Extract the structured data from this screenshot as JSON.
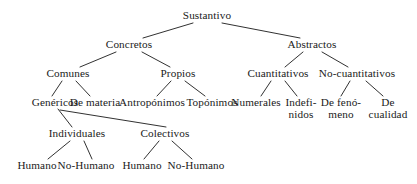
{
  "diagram": {
    "title": "Sustantivo",
    "type": "tree-taxonomy",
    "language": "es",
    "colors": {
      "background": "#ffffff",
      "text": "#1a1a1a",
      "edge": "#1a1a1a"
    },
    "nodes": [
      {
        "id": "sustantivo",
        "label": "Sustantivo",
        "lines": [
          "Sustantivo"
        ],
        "x": 207,
        "y": 16,
        "level": 0
      },
      {
        "id": "concretos",
        "label": "Concretos",
        "lines": [
          "Concretos"
        ],
        "x": 129,
        "y": 45,
        "level": 1
      },
      {
        "id": "abstractos",
        "label": "Abstractos",
        "lines": [
          "Abstractos"
        ],
        "x": 312,
        "y": 45,
        "level": 1
      },
      {
        "id": "comunes",
        "label": "Comunes",
        "lines": [
          "Comunes"
        ],
        "x": 68,
        "y": 74,
        "level": 2
      },
      {
        "id": "propios",
        "label": "Propios",
        "lines": [
          "Propios"
        ],
        "x": 178,
        "y": 74,
        "level": 2
      },
      {
        "id": "cuantitativos",
        "label": "Cuantitativos",
        "lines": [
          "Cuantitativos"
        ],
        "x": 278,
        "y": 74,
        "level": 2
      },
      {
        "id": "no-cuantitativos",
        "label": "No-cuantitativos",
        "lines": [
          "No-cuantitativos"
        ],
        "x": 357,
        "y": 74,
        "level": 2
      },
      {
        "id": "genericos",
        "label": "Genéricos",
        "lines": [
          "Genéricos"
        ],
        "x": 55,
        "y": 103,
        "level": 3
      },
      {
        "id": "de-materia",
        "label": "De materia",
        "lines": [
          "De materia"
        ],
        "x": 95,
        "y": 103,
        "level": 3
      },
      {
        "id": "antroponimos",
        "label": "Antropónimos",
        "lines": [
          "Antropónimos"
        ],
        "x": 152,
        "y": 103,
        "level": 3
      },
      {
        "id": "toponimos",
        "label": "Topónimos",
        "lines": [
          "Topónimos"
        ],
        "x": 212,
        "y": 103,
        "level": 3
      },
      {
        "id": "numerales",
        "label": "Numerales",
        "lines": [
          "Numerales"
        ],
        "x": 256,
        "y": 103,
        "level": 3
      },
      {
        "id": "indefinidos",
        "label": "Indefi- nidos",
        "lines": [
          "Indefi-",
          "nidos"
        ],
        "x": 301,
        "y": 108,
        "level": 3
      },
      {
        "id": "de-fenomeno",
        "label": "De fenó- meno",
        "lines": [
          "De fenó-",
          "meno"
        ],
        "x": 341,
        "y": 108,
        "level": 3
      },
      {
        "id": "de-cualidad",
        "label": "De cualidad",
        "lines": [
          "De",
          "cualidad"
        ],
        "x": 388,
        "y": 108,
        "level": 3
      },
      {
        "id": "individuales",
        "label": "Individuales",
        "lines": [
          "Individuales"
        ],
        "x": 77,
        "y": 134,
        "level": 4
      },
      {
        "id": "colectivos",
        "label": "Colectivos",
        "lines": [
          "Colectivos"
        ],
        "x": 165,
        "y": 134,
        "level": 4
      },
      {
        "id": "humano-ind",
        "label": "Humano",
        "lines": [
          "Humano"
        ],
        "x": 37,
        "y": 166,
        "level": 5
      },
      {
        "id": "no-humano-ind",
        "label": "No-Humano",
        "lines": [
          "No-Humano"
        ],
        "x": 86,
        "y": 166,
        "level": 5
      },
      {
        "id": "humano-col",
        "label": "Humano",
        "lines": [
          "Humano"
        ],
        "x": 142,
        "y": 166,
        "level": 5
      },
      {
        "id": "no-humano-col",
        "label": "No-Humano",
        "lines": [
          "No-Humano"
        ],
        "x": 196,
        "y": 166,
        "level": 5
      }
    ],
    "edges": [
      {
        "id": "sustantivo-concretos",
        "from": "sustantivo",
        "to": "concretos",
        "x1": 193,
        "y1": 23,
        "x2": 143,
        "y2": 38
      },
      {
        "id": "sustantivo-abstractos",
        "from": "sustantivo",
        "to": "abstractos",
        "x1": 222,
        "y1": 23,
        "x2": 300,
        "y2": 38
      },
      {
        "id": "concretos-comunes",
        "from": "concretos",
        "to": "comunes",
        "x1": 116,
        "y1": 52,
        "x2": 80,
        "y2": 67
      },
      {
        "id": "concretos-propios",
        "from": "concretos",
        "to": "propios",
        "x1": 142,
        "y1": 52,
        "x2": 170,
        "y2": 67
      },
      {
        "id": "abstractos-cuantitativos",
        "from": "abstractos",
        "to": "cuantitativos",
        "x1": 303,
        "y1": 52,
        "x2": 285,
        "y2": 67
      },
      {
        "id": "abstractos-no-cuantitativos",
        "from": "abstractos",
        "to": "no-cuantitativos",
        "x1": 322,
        "y1": 52,
        "x2": 348,
        "y2": 67
      },
      {
        "id": "comunes-genericos",
        "from": "comunes",
        "to": "genericos",
        "x1": 62,
        "y1": 81,
        "x2": 52,
        "y2": 96
      },
      {
        "id": "comunes-de-materia",
        "from": "comunes",
        "to": "de-materia",
        "x1": 76,
        "y1": 81,
        "x2": 90,
        "y2": 96
      },
      {
        "id": "propios-antroponimos",
        "from": "propios",
        "to": "antroponimos",
        "x1": 171,
        "y1": 81,
        "x2": 157,
        "y2": 96
      },
      {
        "id": "propios-toponimos",
        "from": "propios",
        "to": "toponimos",
        "x1": 185,
        "y1": 81,
        "x2": 205,
        "y2": 96
      },
      {
        "id": "cuantitativos-numerales",
        "from": "cuantitativos",
        "to": "numerales",
        "x1": 271,
        "y1": 81,
        "x2": 261,
        "y2": 96
      },
      {
        "id": "cuantitativos-indefinidos",
        "from": "cuantitativos",
        "to": "indefinidos",
        "x1": 285,
        "y1": 81,
        "x2": 297,
        "y2": 96
      },
      {
        "id": "no-cuantitativos-de-fenomeno",
        "from": "no-cuantitativos",
        "to": "de-fenomeno",
        "x1": 350,
        "y1": 81,
        "x2": 341,
        "y2": 96
      },
      {
        "id": "no-cuantitativos-de-cualidad",
        "from": "no-cuantitativos",
        "to": "de-cualidad",
        "x1": 366,
        "y1": 81,
        "x2": 383,
        "y2": 96
      },
      {
        "id": "genericos-individuales",
        "from": "genericos",
        "to": "individuales",
        "x1": 58,
        "y1": 109,
        "x2": 72,
        "y2": 127
      },
      {
        "id": "genericos-colectivos",
        "from": "genericos",
        "to": "colectivos",
        "x1": 60,
        "y1": 110,
        "x2": 166,
        "y2": 127
      },
      {
        "id": "individuales-humano",
        "from": "individuales",
        "to": "humano-ind",
        "x1": 70,
        "y1": 141,
        "x2": 48,
        "y2": 159
      },
      {
        "id": "individuales-no-humano",
        "from": "individuales",
        "to": "no-humano-ind",
        "x1": 84,
        "y1": 141,
        "x2": 92,
        "y2": 159
      },
      {
        "id": "colectivos-humano",
        "from": "colectivos",
        "to": "humano-col",
        "x1": 159,
        "y1": 141,
        "x2": 144,
        "y2": 159
      },
      {
        "id": "colectivos-no-humano",
        "from": "colectivos",
        "to": "no-humano-col",
        "x1": 172,
        "y1": 141,
        "x2": 192,
        "y2": 159
      }
    ]
  }
}
